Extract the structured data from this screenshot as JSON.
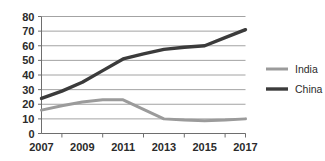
{
  "chart_data": {
    "type": "line",
    "title": "",
    "xlabel": "",
    "ylabel": "",
    "x": [
      2007,
      2008,
      2009,
      2010,
      2011,
      2012,
      2013,
      2014,
      2015,
      2016,
      2017
    ],
    "xtick_labels": [
      "2007",
      "2009",
      "2011",
      "2013",
      "2015",
      "2017"
    ],
    "xtick_values": [
      2007,
      2009,
      2011,
      2013,
      2015,
      2017
    ],
    "xlim": [
      2007,
      2017
    ],
    "ytick_labels": [
      "0",
      "10",
      "20",
      "30",
      "40",
      "50",
      "60",
      "70",
      "80"
    ],
    "ytick_values": [
      0,
      10,
      20,
      30,
      40,
      50,
      60,
      70,
      80
    ],
    "ylim": [
      0,
      80
    ],
    "grid": true,
    "legend_position": "right",
    "series": [
      {
        "name": "India",
        "color": "#9b9b9b",
        "line_width": 3,
        "values": [
          16,
          19,
          21.5,
          23,
          23,
          16.5,
          10,
          9.2,
          8.8,
          9.2,
          10
        ]
      },
      {
        "name": "China",
        "color": "#3b3b3b",
        "line_width": 3.4,
        "values": [
          24,
          29,
          35,
          43,
          51,
          54.5,
          57.5,
          59,
          60,
          65.5,
          71
        ]
      }
    ]
  },
  "legend": {
    "entries": [
      {
        "label": "India"
      },
      {
        "label": "China"
      }
    ]
  },
  "colors": {
    "background": "#ffffff",
    "grid": "#8c8c8c",
    "axis": "#6e6e6e",
    "text": "#2b2b2b",
    "india": "#9b9b9b",
    "china": "#3b3b3b"
  }
}
